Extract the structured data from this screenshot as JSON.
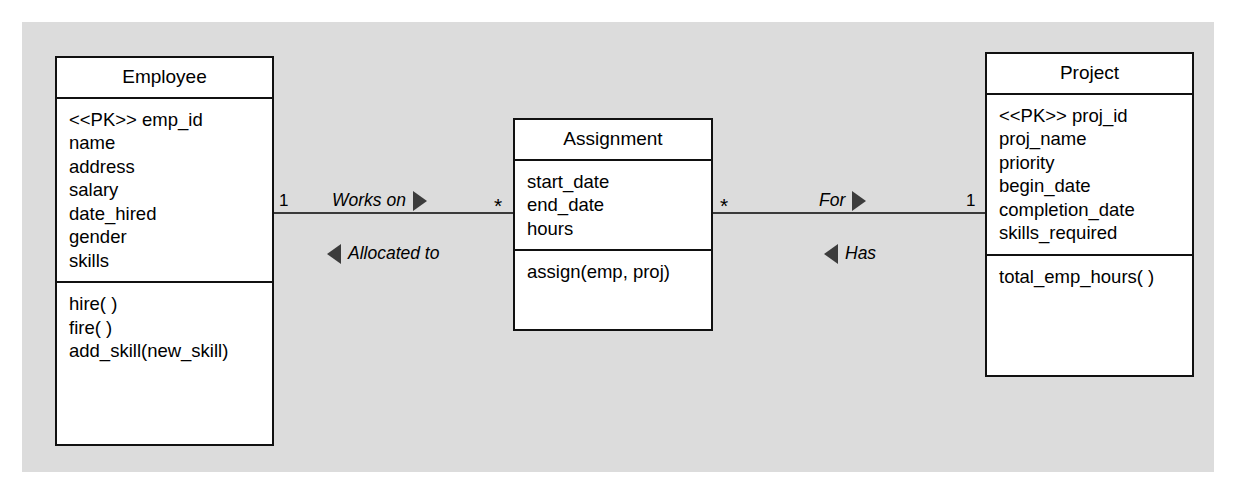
{
  "diagram": {
    "type": "uml-class-diagram",
    "background_color": "#dcdcdc",
    "line_color": "#3a3a3a",
    "classes": [
      {
        "id": "employee",
        "name": "Employee",
        "attributes": [
          "<<PK>> emp_id",
          "name",
          "address",
          "salary",
          "date_hired",
          "gender",
          "skills"
        ],
        "operations": [
          "hire( )",
          "fire( )",
          "add_skill(new_skill)"
        ]
      },
      {
        "id": "assignment",
        "name": "Assignment",
        "attributes": [
          "start_date",
          "end_date",
          "hours"
        ],
        "operations": [
          "assign(emp, proj)"
        ]
      },
      {
        "id": "project",
        "name": "Project",
        "attributes": [
          "<<PK>> proj_id",
          "proj_name",
          "priority",
          "begin_date",
          "completion_date",
          "skills_required"
        ],
        "operations": [
          "total_emp_hours( )"
        ]
      }
    ],
    "associations": [
      {
        "id": "employee-assignment",
        "from": "Employee",
        "to": "Assignment",
        "source_multiplicity": "1",
        "target_multiplicity": "*",
        "forward_label": "Works on",
        "forward_direction": "right",
        "reverse_label": "Allocated to",
        "reverse_direction": "left"
      },
      {
        "id": "assignment-project",
        "from": "Assignment",
        "to": "Project",
        "source_multiplicity": "*",
        "target_multiplicity": "1",
        "forward_label": "For",
        "forward_direction": "right",
        "reverse_label": "Has",
        "reverse_direction": "left"
      }
    ]
  }
}
